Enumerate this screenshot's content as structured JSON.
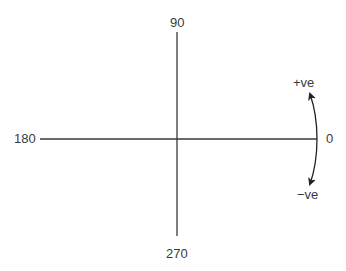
{
  "diagram": {
    "type": "angle-convention",
    "labels": {
      "top": "90",
      "left": "180",
      "bottom": "270",
      "right": "0",
      "positive": "+ve",
      "negative": "−ve"
    },
    "colors": {
      "line": "#3a3a3a",
      "text": "#3a3a3a",
      "background": "#ffffff"
    }
  }
}
